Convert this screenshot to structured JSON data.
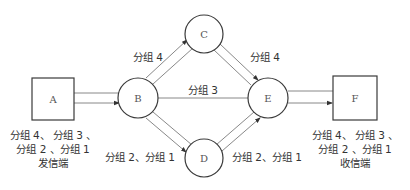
{
  "diagram": {
    "type": "packet-switching-network",
    "nodes": {
      "A": {
        "label": "A",
        "shape": "square"
      },
      "B": {
        "label": "B",
        "shape": "circle"
      },
      "C": {
        "label": "C",
        "shape": "circle"
      },
      "D": {
        "label": "D",
        "shape": "circle"
      },
      "E": {
        "label": "E",
        "shape": "circle"
      },
      "F": {
        "label": "F",
        "shape": "square"
      }
    },
    "edges": [
      {
        "from": "A",
        "to": "B",
        "label": ""
      },
      {
        "from": "B",
        "to": "C",
        "label": "分组 4"
      },
      {
        "from": "C",
        "to": "E",
        "label": "分组 4"
      },
      {
        "from": "B",
        "to": "E",
        "label": "分组 3"
      },
      {
        "from": "B",
        "to": "D",
        "label": "分组 2、分组 1"
      },
      {
        "from": "D",
        "to": "E",
        "label": "分组 2、分组 1"
      },
      {
        "from": "E",
        "to": "F",
        "label": ""
      }
    ],
    "sender": {
      "line1": "分组 4、 分组 3 、",
      "line2": "分组 2 、分组 1",
      "caption": "发信端"
    },
    "receiver": {
      "line1": "分组 4、 分组 3 、",
      "line2": "分组 2 、分组 1",
      "caption": "收信端"
    }
  }
}
